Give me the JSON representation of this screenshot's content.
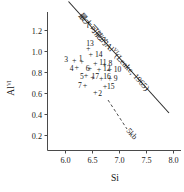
{
  "chart_data": {
    "type": "scatter",
    "title": "",
    "xlabel": "Si",
    "ylabel": "Al",
    "ylabel_superscript": "VI",
    "xlim": [
      5.65,
      8.2
    ],
    "ylim": [
      0.08,
      1.35
    ],
    "xticks": [
      "6.0",
      "6.5",
      "7.0",
      "7.5",
      "8.0"
    ],
    "xtick_values": [
      6.0,
      6.5,
      7.0,
      7.5,
      8.0
    ],
    "yticks": [
      "1.2",
      "1.0",
      "0.8",
      "0.6",
      "0.4",
      "0.2"
    ],
    "ytick_values": [
      1.2,
      1.0,
      0.8,
      0.6,
      0.4,
      0.2
    ],
    "grid": false,
    "legend": "none",
    "marker": "plus",
    "points": [
      {
        "label": "13",
        "x": 6.42,
        "y": 1.03,
        "label_dx": -2,
        "label_dy": -5
      },
      {
        "label": "14",
        "x": 6.47,
        "y": 0.98,
        "label_dx": 4,
        "label_dy": 1
      },
      {
        "label": "3",
        "x": 6.16,
        "y": 0.915,
        "label_dx": -10,
        "label_dy": -1
      },
      {
        "label": "1",
        "x": 6.3,
        "y": 0.905,
        "label_dx": -3,
        "label_dy": -3
      },
      {
        "label": "11",
        "x": 6.55,
        "y": 0.895,
        "label_dx": 4,
        "label_dy": 0
      },
      {
        "label": "8",
        "x": 6.72,
        "y": 0.885,
        "label_dx": 4,
        "label_dy": 0
      },
      {
        "label": "4",
        "x": 6.21,
        "y": 0.855,
        "label_dx": -7,
        "label_dy": 2
      },
      {
        "label": "6",
        "x": 6.45,
        "y": 0.845,
        "label_dx": -4,
        "label_dy": 1
      },
      {
        "label": "12",
        "x": 6.62,
        "y": 0.835,
        "label_dx": 4,
        "label_dy": 0
      },
      {
        "label": "10",
        "x": 6.82,
        "y": 0.83,
        "label_dx": 4,
        "label_dy": 0
      },
      {
        "label": "5",
        "x": 6.38,
        "y": 0.775,
        "label_dx": -6,
        "label_dy": 1
      },
      {
        "label": "17",
        "x": 6.5,
        "y": 0.755,
        "label_dx": -1,
        "label_dy": -1
      },
      {
        "label": "16",
        "x": 6.66,
        "y": 0.75,
        "label_dx": 2,
        "label_dy": -1
      },
      {
        "label": "9",
        "x": 6.82,
        "y": 0.745,
        "label_dx": 4,
        "label_dy": 0
      },
      {
        "label": "7",
        "x": 6.36,
        "y": 0.685,
        "label_dx": -7,
        "label_dy": 1
      },
      {
        "label": "15",
        "x": 6.73,
        "y": 0.675,
        "label_dx": 2,
        "label_dy": 1
      },
      {
        "label": "2",
        "x": 6.55,
        "y": 0.615,
        "label_dx": 3,
        "label_dy": 1
      }
    ],
    "lines": [
      {
        "name": "max-possible-al-vi",
        "style": "solid",
        "x0": 5.95,
        "y0": 1.43,
        "x1": 8.07,
        "y1": 0.36,
        "label_main": "最大可能的Al",
        "label_superscript": "VI",
        "label_citation": "(Leake, 1965)"
      },
      {
        "name": "five-kb",
        "style": "dashed",
        "x0": 6.77,
        "y0": 0.66,
        "x1": 7.13,
        "y1": 0.38,
        "label": "5kb"
      }
    ]
  },
  "axes": {
    "x_axis_name": "Si",
    "y_axis_name": "Al"
  }
}
